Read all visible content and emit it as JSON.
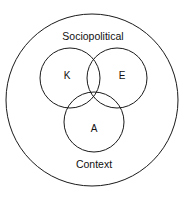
{
  "diagram": {
    "type": "venn",
    "outer_circle": {
      "label_top": "Sociopolitical",
      "label_bottom": "Context"
    },
    "circles": [
      {
        "id": "K",
        "label": "K"
      },
      {
        "id": "E",
        "label": "E"
      },
      {
        "id": "A",
        "label": "A"
      }
    ],
    "colors": {
      "stroke": "#1a1a1a",
      "background": "#ffffff",
      "text": "#111111"
    }
  }
}
